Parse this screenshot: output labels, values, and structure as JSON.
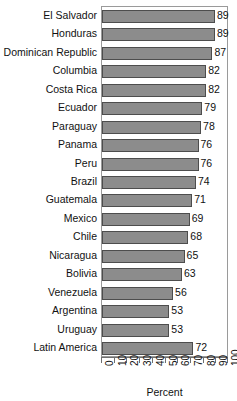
{
  "chart_data": {
    "type": "bar",
    "orientation": "horizontal",
    "title": "",
    "xlabel": "Percent",
    "ylabel": "",
    "xlim": [
      0,
      100
    ],
    "xticks": [
      "0",
      "10",
      "20",
      "30",
      "40",
      "50",
      "60",
      "70",
      "80",
      "90",
      "100"
    ],
    "grid": false,
    "legend": null,
    "bar_color": "#8c8c8c",
    "bar_edge_color": "#4d4d4d",
    "frame_color": "#9a9a9a",
    "categories": [
      "El Salvador",
      "Honduras",
      "Dominican Republic",
      "Columbia",
      "Costa Rica",
      "Ecuador",
      "Paraguay",
      "Panama",
      "Peru",
      "Brazil",
      "Guatemala",
      "Mexico",
      "Chile",
      "Nicaragua",
      "Bolivia",
      "Venezuela",
      "Argentina",
      "Uruguay",
      "Latin America"
    ],
    "values": [
      89,
      89,
      87,
      82,
      82,
      79,
      78,
      76,
      76,
      74,
      71,
      69,
      68,
      65,
      63,
      56,
      53,
      53,
      72
    ],
    "data_labels": [
      "89",
      "89",
      "87",
      "82",
      "82",
      "79",
      "78",
      "76",
      "76",
      "74",
      "71",
      "69",
      "68",
      "65",
      "63",
      "56",
      "53",
      "53",
      "72"
    ]
  }
}
